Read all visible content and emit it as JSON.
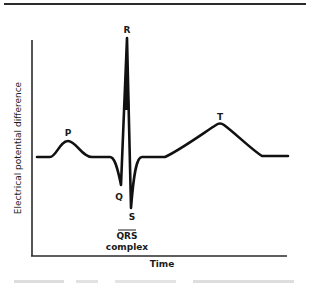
{
  "figure": {
    "type": "ECG waveform diagram",
    "y_axis_label": "Electrical potential difference",
    "x_axis_label": "Time",
    "waves": [
      {
        "id": "P",
        "label": "P"
      },
      {
        "id": "Q",
        "label": "Q"
      },
      {
        "id": "R",
        "label": "R"
      },
      {
        "id": "S",
        "label": "S"
      },
      {
        "id": "T",
        "label": "T"
      }
    ],
    "complex_label": {
      "line1": "QRS",
      "line2": "complex"
    }
  },
  "colors": {
    "ink": "#1a1a1a",
    "background": "#ffffff"
  }
}
